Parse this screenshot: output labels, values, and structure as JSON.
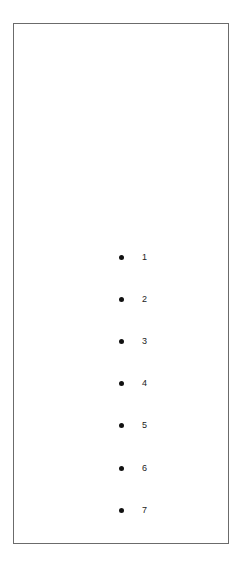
{
  "list": {
    "items": [
      {
        "label": "1"
      },
      {
        "label": "2"
      },
      {
        "label": "3"
      },
      {
        "label": "4"
      },
      {
        "label": "5"
      },
      {
        "label": "6"
      },
      {
        "label": "7"
      }
    ]
  },
  "colors": {
    "border": "#6b6b6b",
    "bullet": "#111111",
    "text": "#222222",
    "background": "#ffffff"
  }
}
